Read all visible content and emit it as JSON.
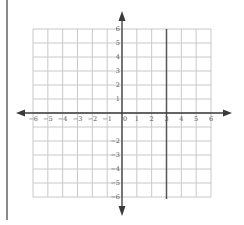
{
  "chart_data": {
    "type": "line",
    "title": "",
    "xlabel": "",
    "ylabel": "",
    "xlim": [
      -6,
      6
    ],
    "ylim": [
      -6,
      6
    ],
    "grid": true,
    "x_ticks": [
      -6,
      -5,
      -4,
      -3,
      -2,
      -1,
      0,
      1,
      2,
      3,
      4,
      5,
      6
    ],
    "x_tick_labels": [
      "-6",
      "-5",
      "-4",
      "-3",
      "-2",
      "-1",
      "0",
      "1",
      "2",
      "3",
      "4",
      "5",
      "6"
    ],
    "y_ticks": [
      6,
      5,
      4,
      3,
      2,
      1,
      -2,
      -3,
      -4,
      -5,
      -6
    ],
    "y_tick_labels": [
      "6",
      "5",
      "4",
      "3",
      "2",
      "1",
      "-2",
      "-3",
      "-4",
      "-5",
      "-6"
    ],
    "series": [
      {
        "name": "x = 3",
        "type": "vertical-line",
        "x": 3,
        "y_range": [
          -6,
          6
        ]
      }
    ],
    "axes_arrows": true,
    "legend": null
  },
  "colors": {
    "grid": "#c8c8c8",
    "axis": "#3a3a3a",
    "plotted_line": "#555555",
    "label": "#555555",
    "left_bar": "#8a8a8a"
  }
}
